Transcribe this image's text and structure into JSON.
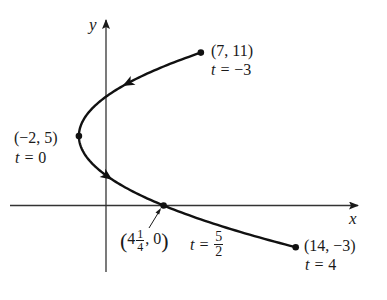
{
  "figure": {
    "type": "parametric-curve-diagram",
    "axes": {
      "x_label": "x",
      "y_label": "y"
    },
    "curve": {
      "x_of_t": "t^2 - 2",
      "y_of_t": "5 - 2t",
      "t_range": [
        -3,
        4
      ],
      "direction": "increasing t"
    },
    "points": [
      {
        "id": "p1",
        "coord_label": "(7, 11)",
        "t_label_prefix": "t = ",
        "t_value": "−3",
        "x": 7,
        "y": 11
      },
      {
        "id": "p2",
        "coord_label": "(−2, 5)",
        "t_label_prefix": "t = ",
        "t_value": "0",
        "x": -2,
        "y": 5
      },
      {
        "id": "p3",
        "coord_whole": "4",
        "coord_num": "1",
        "coord_den": "4",
        "coord_rest": ", 0",
        "t_label_prefix": "t = ",
        "t_num": "5",
        "t_den": "2",
        "x": 4.25,
        "y": 0
      },
      {
        "id": "p4",
        "coord_label": "(14, −3)",
        "t_label_prefix": "t = ",
        "t_value": "4",
        "x": 14,
        "y": -3
      }
    ],
    "colors": {
      "ink": "#1a1a1a",
      "background": "#ffffff"
    }
  }
}
